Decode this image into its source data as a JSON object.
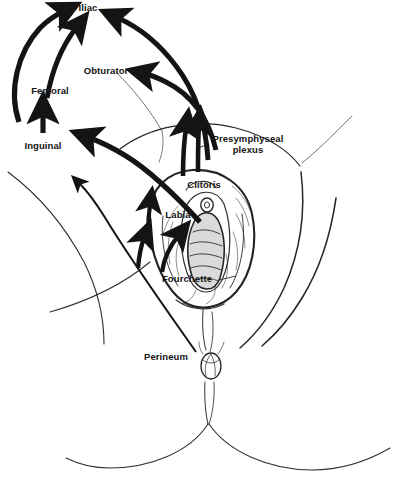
{
  "figure": {
    "background_color": "#ffffff",
    "ink_color": "#141414",
    "outline_color": "#1a1a1a",
    "shading_color": "#d9d9d9"
  },
  "labels": [
    {
      "id": "iliac",
      "text": "Iliac",
      "kind": "node-group",
      "x": 66,
      "y": 3,
      "width": 44,
      "lines": 1
    },
    {
      "id": "obturator",
      "text": "Obturator",
      "kind": "node-group",
      "x": 77,
      "y": 66,
      "width": 58,
      "lines": 1
    },
    {
      "id": "femoral",
      "text": "Femoral",
      "kind": "node-group",
      "x": 24,
      "y": 86,
      "width": 52,
      "lines": 1
    },
    {
      "id": "inguinal",
      "text": "Inguinal",
      "kind": "node-group",
      "x": 17,
      "y": 141,
      "width": 52,
      "lines": 1
    },
    {
      "id": "presymphyseal-plexus",
      "text": "Presymphyseal\nplexus",
      "kind": "structure",
      "x": 206,
      "y": 133,
      "width": 84,
      "lines": 2
    },
    {
      "id": "clitoris",
      "text": "Clitoris",
      "kind": "structure",
      "x": 182,
      "y": 180,
      "width": 44,
      "lines": 1
    },
    {
      "id": "labia",
      "text": "Labia",
      "kind": "structure",
      "x": 161,
      "y": 210,
      "width": 34,
      "lines": 1
    },
    {
      "id": "fourchette",
      "text": "Fourchette",
      "kind": "structure",
      "x": 156,
      "y": 274,
      "width": 62,
      "lines": 1
    },
    {
      "id": "perineum",
      "text": "Perineum",
      "kind": "structure",
      "x": 137,
      "y": 352,
      "width": 58,
      "lines": 1
    }
  ],
  "drainage_routes": [
    {
      "from": "inguinal",
      "to": "femoral",
      "style": "thick-straight-arrow"
    },
    {
      "from": "femoral",
      "to": "iliac",
      "style": "thick-curved-arrow"
    },
    {
      "from": "inguinal-lateral",
      "to": "iliac",
      "style": "thick-curved-arrow"
    },
    {
      "from": "presymphyseal-plexus",
      "to": "iliac",
      "style": "thick-curved-arrow"
    },
    {
      "from": "clitoris",
      "to": "obturator",
      "style": "thick-curved-arrow"
    },
    {
      "from": "labia",
      "to": "inguinal",
      "style": "thick-curved-arrow"
    },
    {
      "from": "perineum",
      "to": "inguinal-lower",
      "style": "thin-curved-arrow"
    },
    {
      "from": "fourchette",
      "to": "labia",
      "style": "short-thick-arrow"
    },
    {
      "from": "clitoris",
      "to": "presymphyseal-plexus",
      "style": "short-thick-arrow"
    }
  ]
}
